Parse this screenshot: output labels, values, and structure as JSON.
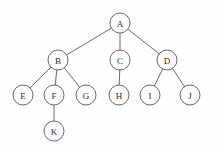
{
  "figure": {
    "kind": "tree-diagram",
    "background_color": "#fefefe",
    "stroke_color": "#5a5a5a",
    "node_fill_color": "#ffffff",
    "label_color": "#2b2b2b",
    "node_radius": 10,
    "width": 218,
    "height": 153
  },
  "nodes": [
    {
      "id": "A",
      "label": "A",
      "x": 120,
      "y": 23,
      "level": 0
    },
    {
      "id": "B",
      "label": "B",
      "x": 58,
      "y": 60,
      "level": 1
    },
    {
      "id": "C",
      "label": "C",
      "x": 120,
      "y": 60,
      "level": 1
    },
    {
      "id": "D",
      "label": "D",
      "x": 167,
      "y": 60,
      "level": 1
    },
    {
      "id": "E",
      "label": "E",
      "x": 23,
      "y": 95,
      "level": 2
    },
    {
      "id": "F",
      "label": "F",
      "x": 54,
      "y": 95,
      "level": 2
    },
    {
      "id": "G",
      "label": "G",
      "x": 86,
      "y": 95,
      "level": 2
    },
    {
      "id": "H",
      "label": "H",
      "x": 119,
      "y": 95,
      "level": 2
    },
    {
      "id": "I",
      "label": "I",
      "x": 150,
      "y": 95,
      "level": 2
    },
    {
      "id": "J",
      "label": "J",
      "x": 190,
      "y": 95,
      "level": 2
    },
    {
      "id": "K",
      "label": "K",
      "x": 54,
      "y": 131,
      "level": 3
    }
  ],
  "edges": [
    {
      "from": "A",
      "to": "B"
    },
    {
      "from": "A",
      "to": "C"
    },
    {
      "from": "A",
      "to": "D"
    },
    {
      "from": "B",
      "to": "E"
    },
    {
      "from": "B",
      "to": "F"
    },
    {
      "from": "B",
      "to": "G"
    },
    {
      "from": "C",
      "to": "H"
    },
    {
      "from": "D",
      "to": "I"
    },
    {
      "from": "D",
      "to": "J"
    },
    {
      "from": "F",
      "to": "K"
    }
  ]
}
